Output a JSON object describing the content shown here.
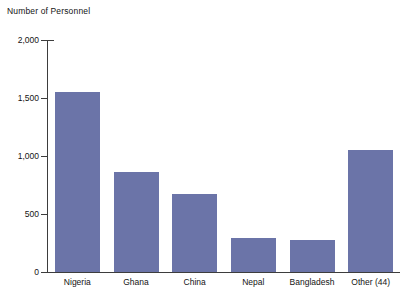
{
  "chart_data": {
    "type": "bar",
    "title": "Number of Personnel",
    "xlabel": "",
    "ylabel": "Number of Personnel",
    "categories": [
      "Nigeria",
      "Ghana",
      "China",
      "Nepal",
      "Bangladesh",
      "Other (44)"
    ],
    "values": [
      1555,
      860,
      670,
      290,
      280,
      1055
    ],
    "ylim": [
      0,
      2000
    ],
    "yticks": [
      0,
      500,
      1000,
      1500,
      2000
    ],
    "ytick_labels": [
      "0",
      "500",
      "1,000",
      "1,500",
      "2,000"
    ],
    "grid": false,
    "legend": false,
    "bar_color": "#6b74a8",
    "axis_color": "#3d3d3d",
    "background": "#ffffff"
  },
  "axis": {
    "title": "Number of Personnel"
  }
}
